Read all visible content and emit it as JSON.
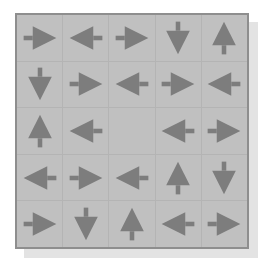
{
  "figure": {
    "name": "arrow-direction-grid",
    "rows": 5,
    "columns": 5,
    "total_cells": 25,
    "filled_cells": 24,
    "empty_cells": 1,
    "colors": {
      "page_background": "#ffffff",
      "cell_fill": "#c0c0c0",
      "grid_line": "#b4b4b4",
      "outer_border": "#8e8e8e",
      "arrow_fill": "#7d7d7d",
      "drop_shadow": "#e3e3e3"
    }
  },
  "grid": {
    "rows": [
      {
        "index": 1,
        "cells": [
          {
            "index": 1,
            "direction": "right",
            "icon": "arrow-right-icon",
            "empty": false
          },
          {
            "index": 2,
            "direction": "left",
            "icon": "arrow-left-icon",
            "empty": false
          },
          {
            "index": 3,
            "direction": "right",
            "icon": "arrow-right-icon",
            "empty": false
          },
          {
            "index": 4,
            "direction": "down",
            "icon": "arrow-down-icon",
            "empty": false
          },
          {
            "index": 5,
            "direction": "up",
            "icon": "arrow-up-icon",
            "empty": false
          }
        ]
      },
      {
        "index": 2,
        "cells": [
          {
            "index": 1,
            "direction": "down",
            "icon": "arrow-down-icon",
            "empty": false
          },
          {
            "index": 2,
            "direction": "right",
            "icon": "arrow-right-icon",
            "empty": false
          },
          {
            "index": 3,
            "direction": "left",
            "icon": "arrow-left-icon",
            "empty": false
          },
          {
            "index": 4,
            "direction": "right",
            "icon": "arrow-right-icon",
            "empty": false
          },
          {
            "index": 5,
            "direction": "left",
            "icon": "arrow-left-icon",
            "empty": false
          }
        ]
      },
      {
        "index": 3,
        "cells": [
          {
            "index": 1,
            "direction": "up",
            "icon": "arrow-up-icon",
            "empty": false
          },
          {
            "index": 2,
            "direction": "left",
            "icon": "arrow-left-icon",
            "empty": false
          },
          {
            "index": 3,
            "direction": "none",
            "icon": "",
            "empty": true
          },
          {
            "index": 4,
            "direction": "left",
            "icon": "arrow-left-icon",
            "empty": false
          },
          {
            "index": 5,
            "direction": "right",
            "icon": "arrow-right-icon",
            "empty": false
          }
        ]
      },
      {
        "index": 4,
        "cells": [
          {
            "index": 1,
            "direction": "left",
            "icon": "arrow-left-icon",
            "empty": false
          },
          {
            "index": 2,
            "direction": "right",
            "icon": "arrow-right-icon",
            "empty": false
          },
          {
            "index": 3,
            "direction": "left",
            "icon": "arrow-left-icon",
            "empty": false
          },
          {
            "index": 4,
            "direction": "up",
            "icon": "arrow-up-icon",
            "empty": false
          },
          {
            "index": 5,
            "direction": "down",
            "icon": "arrow-down-icon",
            "empty": false
          }
        ]
      },
      {
        "index": 5,
        "cells": [
          {
            "index": 1,
            "direction": "right",
            "icon": "arrow-right-icon",
            "empty": false
          },
          {
            "index": 2,
            "direction": "down",
            "icon": "arrow-down-icon",
            "empty": false
          },
          {
            "index": 3,
            "direction": "up",
            "icon": "arrow-up-icon",
            "empty": false
          },
          {
            "index": 4,
            "direction": "left",
            "icon": "arrow-left-icon",
            "empty": false
          },
          {
            "index": 5,
            "direction": "right",
            "icon": "arrow-right-icon",
            "empty": false
          }
        ]
      }
    ]
  }
}
